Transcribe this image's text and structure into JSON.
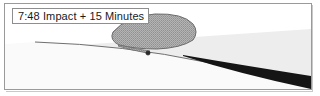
{
  "figure": {
    "caption_box": {
      "text": "7:48 Impact + 15 Minutes",
      "time": "7:48",
      "event": "Impact",
      "offset": "+ 15 Minutes"
    },
    "colors": {
      "frame_border": "#9a9a9a",
      "label_border": "#8e8e8e",
      "label_text": "#1a1a1a",
      "sky_upper": "#ffffff",
      "sky_haze": "#ededed",
      "ground": "#fafafa",
      "horizon_line": "#6f6f6f",
      "plume_fill": "#a8a8a8",
      "plume_outline": "#6b6b6b",
      "shadow_wedge": "#151515",
      "impact_marker": "#2b2b2b"
    },
    "elements": {
      "horizon_label": "planet-limb-curve",
      "plume_label": "ejecta-plume",
      "impact_marker_label": "impact-point",
      "shadow_label": "debris-shadow-wedge",
      "haze_label": "atmospheric-haze-band"
    }
  }
}
